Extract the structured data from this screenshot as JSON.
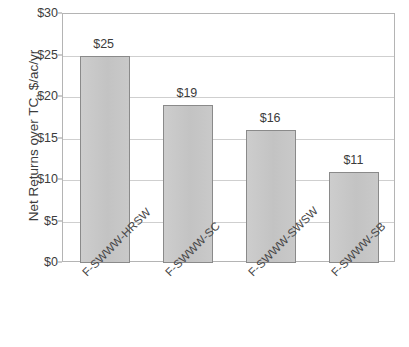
{
  "chart_data": {
    "type": "bar",
    "title": "",
    "xlabel": "",
    "ylabel": "Net Returns over TC, $/ac/yr",
    "categories": [
      "F-SWWW-HRSW",
      "F-SWWW-SC",
      "F-SWWW-SWSW",
      "F-SWWW-SB"
    ],
    "values": [
      25,
      19,
      16,
      11
    ],
    "data_labels": [
      "$25",
      "$19",
      "$16",
      "$11"
    ],
    "ylim": [
      0,
      30
    ],
    "ytick_values": [
      0,
      5,
      10,
      15,
      20,
      25,
      30
    ],
    "ytick_labels": [
      "$0",
      "$5",
      "$10",
      "$15",
      "$20",
      "$25",
      "$30"
    ],
    "grid": true,
    "legend": "none",
    "bar_fill_color": "#c6c6c6",
    "bar_border_color": "#8a8a8a",
    "gridline_color": "#cfcfcf",
    "axis_color": "#b4b4b4",
    "text_color": "#3c3c3c"
  },
  "axis": {
    "y_title": "Net Returns over TC, $/ac/yr"
  }
}
